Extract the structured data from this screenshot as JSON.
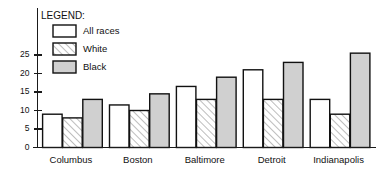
{
  "legend": {
    "title": "LEGEND:",
    "entries": [
      {
        "label": "All races",
        "swatch": "white-box-icon",
        "fill": "#ffffff"
      },
      {
        "label": "White",
        "swatch": "hatched-box-icon",
        "fill": "hatch"
      },
      {
        "label": "Black",
        "swatch": "gray-box-icon",
        "fill": "#d0d0d0"
      }
    ]
  },
  "colors": {
    "all_races": "#ffffff",
    "white": "#f2f2f2",
    "black": "#d0d0d0",
    "outline": "#111111",
    "axis": "#1a1a1a",
    "background": "#ffffff"
  },
  "axis": {
    "y_ticks": [
      "0",
      "5",
      "10",
      "15",
      "20",
      "25"
    ],
    "y_tick_values": [
      0,
      5,
      10,
      15,
      20,
      25
    ]
  },
  "chart_data": {
    "type": "bar",
    "title": "",
    "subtitle": "",
    "xlabel": "",
    "ylabel": "",
    "ylim": [
      0,
      27
    ],
    "grid": false,
    "legend_position": "top-left",
    "categories": [
      "Columbus",
      "Boston",
      "Baltimore",
      "Detroit",
      "Indianapolis"
    ],
    "series": [
      {
        "name": "All races",
        "values": [
          9,
          11.5,
          16.5,
          21,
          13
        ]
      },
      {
        "name": "White",
        "values": [
          8,
          10,
          13,
          13,
          9
        ]
      },
      {
        "name": "Black",
        "values": [
          13,
          14.5,
          19,
          23,
          25.5
        ]
      }
    ]
  }
}
